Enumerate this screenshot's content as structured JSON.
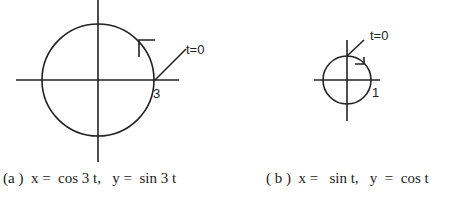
{
  "figures": [
    {
      "id": "a",
      "start_label": "t=0",
      "radius_label": "3",
      "caption": "(a )  x =  cos 3 t,   y =  sin 3 t"
    },
    {
      "id": "b",
      "start_label": "t=0",
      "radius_label": "1",
      "caption": "( b )  x =   sin t,   y  =  cos t"
    }
  ],
  "colors": {
    "stroke": "#222222",
    "background": "#ffffff"
  }
}
